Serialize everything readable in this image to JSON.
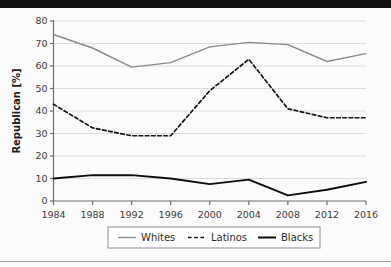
{
  "figure": {
    "background": "#fbfbfb",
    "top_band_color": "#111111",
    "bottom_rule_color": "#9a9a9a"
  },
  "axis": {
    "y_label": "Republican [%]",
    "y_ticks": [
      "0",
      "10",
      "20",
      "30",
      "40",
      "50",
      "60",
      "70",
      "80"
    ],
    "x_ticks": [
      "1984",
      "1988",
      "1992",
      "1996",
      "2000",
      "2004",
      "2008",
      "2012",
      "2016"
    ],
    "axis_color": "#6e6e6e",
    "grid_color": "#dcdcdc",
    "tick_text_color": "#3a3a3a"
  },
  "legend": {
    "border_color": "#8c8c8c",
    "background": "#ffffff",
    "entries": [
      {
        "label": "Whites",
        "color": "#8a8a8a",
        "style": "solid",
        "width": 1.4
      },
      {
        "label": "Latinos",
        "color": "#141414",
        "style": "dashed",
        "width": 1.6
      },
      {
        "label": "Blacks",
        "color": "#0d0d0d",
        "style": "solid",
        "width": 2.0
      }
    ]
  },
  "chart_data": {
    "type": "line",
    "title": "",
    "subtitle": "",
    "xlabel": "",
    "ylabel": "Republican [%]",
    "x": [
      1984,
      1988,
      1992,
      1996,
      2000,
      2004,
      2008,
      2012,
      2016
    ],
    "categories": [
      "1984",
      "1988",
      "1992",
      "1996",
      "2000",
      "2004",
      "2008",
      "2012",
      "2016"
    ],
    "xlim": [
      1984,
      2016
    ],
    "ylim": [
      0,
      80
    ],
    "y_ticks": [
      0,
      10,
      20,
      30,
      40,
      50,
      60,
      70,
      80
    ],
    "grid": "horizontal",
    "legend_position": "bottom-center",
    "series": [
      {
        "name": "Whites",
        "color": "#8a8a8a",
        "style": "solid",
        "values": [
          74,
          68,
          59.5,
          61.5,
          68.5,
          70.5,
          69.5,
          62,
          65.5
        ]
      },
      {
        "name": "Latinos",
        "color": "#141414",
        "style": "dashed",
        "values": [
          43,
          32.5,
          29,
          29,
          49,
          63,
          41,
          37,
          37
        ]
      },
      {
        "name": "Blacks",
        "color": "#0d0d0d",
        "style": "solid",
        "values": [
          10,
          11.5,
          11.5,
          10,
          7.5,
          9.5,
          2.5,
          5,
          8.5
        ]
      }
    ]
  }
}
